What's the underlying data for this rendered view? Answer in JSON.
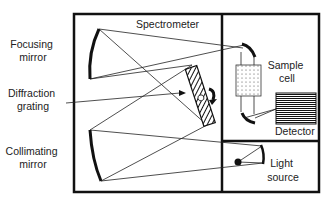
{
  "diagram": {
    "title": "Spectrometer",
    "labels": {
      "focusing_mirror": [
        "Focusing",
        "mirror"
      ],
      "diffraction_grating": [
        "Diffraction",
        "grating"
      ],
      "collimating_mirror": [
        "Collimating",
        "mirror"
      ],
      "sample_cell": [
        "Sample",
        "cell"
      ],
      "detector": "Detector",
      "light_source": [
        "Light",
        "source"
      ]
    },
    "colors": {
      "line": "#111111",
      "background": "#ffffff"
    }
  }
}
